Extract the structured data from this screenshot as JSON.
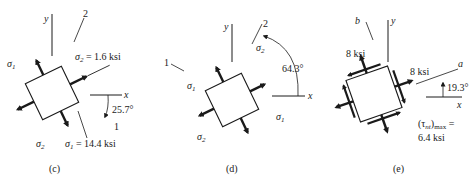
{
  "panels": [
    {
      "caption": "(c)",
      "labels": {
        "y_axis": "y",
        "x_axis": "x",
        "axis1": "1",
        "axis2": "2",
        "sigma1": "σ",
        "sigma1_sub": "1",
        "sigma2": "σ",
        "sigma2_sub": "2",
        "sigma2_value": "σ",
        "sigma2_value_sub": "2",
        "sigma2_value_text": " = 1.6 ksi",
        "sigma1_value": "σ",
        "sigma1_value_sub": "1",
        "sigma1_value_text": " = 14.4 ksi",
        "angle": "25.7°"
      }
    },
    {
      "caption": "(d)",
      "labels": {
        "y_axis": "y",
        "x_axis": "x",
        "axis1": "1",
        "axis2": "2",
        "sigma1_left": "σ",
        "sigma1_left_sub": "1",
        "sigma1_right": "σ",
        "sigma1_right_sub": "1",
        "sigma2_top": "σ",
        "sigma2_top_sub": "2",
        "sigma2_bottom": "σ",
        "sigma2_bottom_sub": "2",
        "angle": "64.3°"
      }
    },
    {
      "caption": "(e)",
      "labels": {
        "y_axis": "y",
        "x_axis": "x",
        "axis_a": "a",
        "axis_b": "b",
        "stress_top": "8 ksi",
        "stress_right": "8 ksi",
        "angle": "19.3°",
        "tau": "(τ",
        "tau_sub": "nt",
        "tau_close": ")",
        "tau_max": "max",
        "tau_eq": " =",
        "tau_value": "6.4 ksi"
      }
    }
  ]
}
